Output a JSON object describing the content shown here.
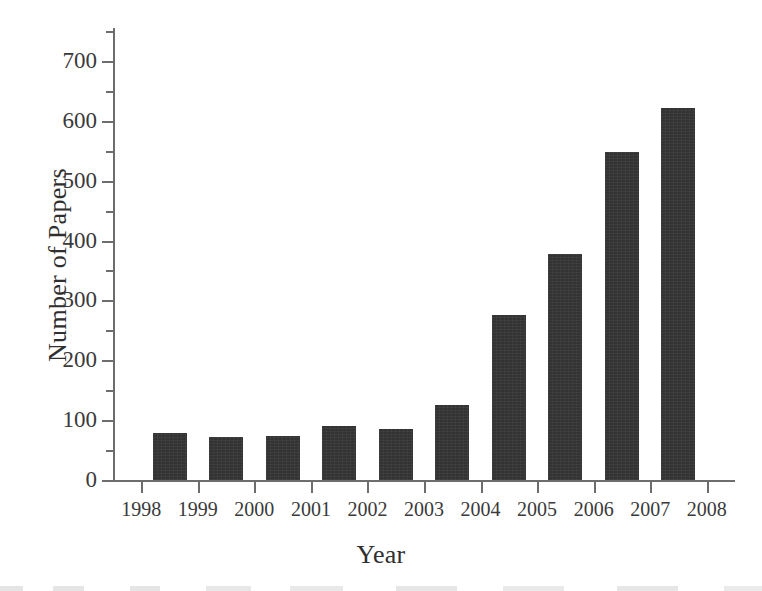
{
  "chart_data": {
    "type": "bar",
    "title": "",
    "xlabel": "Year",
    "ylabel": "Number of Papers",
    "categories": [
      "1998",
      "1999",
      "2000",
      "2001",
      "2002",
      "2003",
      "2004",
      "2005",
      "2006",
      "2007"
    ],
    "values": [
      78,
      72,
      74,
      90,
      85,
      125,
      275,
      378,
      548,
      622
    ],
    "xlim": [
      "1998",
      "2008"
    ],
    "ylim": [
      0,
      755
    ],
    "x_ticks": [
      "1998",
      "1999",
      "2000",
      "2001",
      "2002",
      "2003",
      "2004",
      "2005",
      "2006",
      "2007",
      "2008"
    ],
    "y_ticks": [
      0,
      100,
      200,
      300,
      400,
      500,
      600,
      700
    ],
    "y_minor_ticks": [
      50,
      150,
      250,
      350,
      450,
      550,
      650,
      750
    ],
    "grid": false,
    "legend": null,
    "bar_color": "#333333",
    "axis_color": "#6d6d6d",
    "text_color": "#3a3a3a"
  },
  "axes": {
    "y_title": "Number of Papers",
    "x_title": "Year"
  }
}
